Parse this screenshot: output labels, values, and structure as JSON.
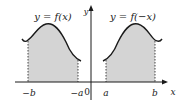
{
  "diagram": {
    "left_graph": {
      "equation": "y = f(x)",
      "interval_start_label": "−b",
      "interval_end_label": "−a",
      "shaded": true
    },
    "right_graph": {
      "equation": "y = f(−x)",
      "interval_start_label": "a",
      "interval_end_label": "b",
      "shaded": true
    },
    "axes": {
      "x_label": "x",
      "y_label": "y",
      "origin_label": "0"
    },
    "colors": {
      "shade": "#d4d4d4",
      "stroke": "#1a1a1a"
    }
  }
}
